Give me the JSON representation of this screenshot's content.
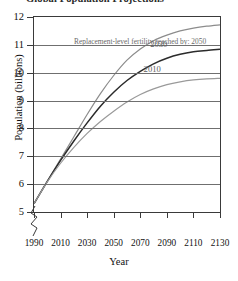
{
  "title": "Global Population Projections",
  "chart_data": {
    "type": "line",
    "title": "Global Population Projections",
    "xlabel": "Year",
    "ylabel": "Population (billions)",
    "xlim": [
      1990,
      2130
    ],
    "ylim": [
      5,
      12
    ],
    "xticks": [
      1990,
      2010,
      2030,
      2050,
      2070,
      2090,
      2110,
      2130
    ],
    "yticks": [
      5,
      6,
      7,
      8,
      9,
      10,
      11,
      12
    ],
    "grid": "horizontal",
    "axis_break": "y-axis broken below 5",
    "legend": "inline curve labels",
    "annotation": "Replacement-level fertility reached by: 2050",
    "annotation_color": "#6a6a6a",
    "series": [
      {
        "name": "2050",
        "label": "2050",
        "color": "#8c8c8c",
        "x": [
          1990,
          2000,
          2010,
          2020,
          2030,
          2040,
          2050,
          2060,
          2070,
          2080,
          2090,
          2100,
          2110,
          2120,
          2130
        ],
        "values": [
          5.3,
          6.1,
          6.9,
          7.7,
          8.5,
          9.25,
          9.9,
          10.45,
          10.85,
          11.15,
          11.35,
          11.5,
          11.6,
          11.67,
          11.72
        ]
      },
      {
        "name": "2030",
        "label": "2030",
        "color": "#2b2b2b",
        "x": [
          1990,
          2000,
          2010,
          2020,
          2030,
          2040,
          2050,
          2060,
          2070,
          2080,
          2090,
          2100,
          2110,
          2120,
          2130
        ],
        "values": [
          5.3,
          6.1,
          6.85,
          7.55,
          8.2,
          8.8,
          9.3,
          9.72,
          10.05,
          10.32,
          10.52,
          10.66,
          10.75,
          10.8,
          10.84
        ]
      },
      {
        "name": "2010",
        "label": "2010",
        "color": "#9a9a9a",
        "x": [
          1990,
          2000,
          2010,
          2020,
          2030,
          2040,
          2050,
          2060,
          2070,
          2080,
          2090,
          2100,
          2110,
          2120,
          2130
        ],
        "values": [
          5.3,
          6.08,
          6.75,
          7.32,
          7.82,
          8.25,
          8.62,
          8.95,
          9.22,
          9.42,
          9.57,
          9.67,
          9.74,
          9.78,
          9.8
        ]
      }
    ]
  }
}
